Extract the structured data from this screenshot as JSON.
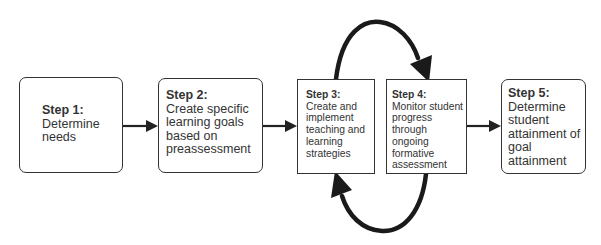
{
  "steps": [
    {
      "title": "Step 1:",
      "lines": [
        "Determine",
        "needs"
      ]
    },
    {
      "title": "Step 2:",
      "lines": [
        "Create specific",
        "learning goals",
        "based on",
        "preassessment"
      ]
    },
    {
      "title": "Step 3:",
      "lines": [
        "Create and",
        "implement",
        "teaching and",
        "learning",
        "strategies"
      ]
    },
    {
      "title": "Step 4:",
      "lines": [
        "Monitor student",
        "progress",
        "through",
        "ongoing",
        "formative",
        "assessment"
      ]
    },
    {
      "title": "Step 5:",
      "lines": [
        "Determine",
        "student",
        "attainment of",
        "goal",
        "attainment"
      ]
    }
  ],
  "connections": [
    {
      "from": "Step 1",
      "to": "Step 2",
      "type": "straight-arrow"
    },
    {
      "from": "Step 2",
      "to": "Step 3",
      "type": "straight-arrow"
    },
    {
      "from": "Step 3",
      "to": "Step 4",
      "type": "curved-arrow-over-top"
    },
    {
      "from": "Step 4",
      "to": "Step 3",
      "type": "curved-arrow-under-bottom"
    },
    {
      "from": "Step 4",
      "to": "Step 5",
      "type": "straight-arrow"
    }
  ]
}
